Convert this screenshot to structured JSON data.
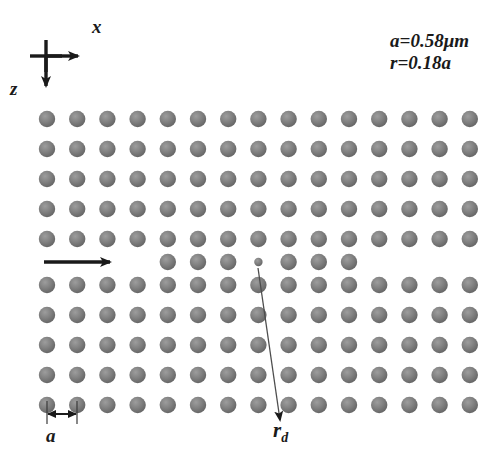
{
  "figure": {
    "type": "schematic",
    "width": 504,
    "height": 464,
    "background_color": "#ffffff",
    "rod_color": "#7a7a7a",
    "rod_highlight_color": "#a8a8a8",
    "rod_shadow_color": "#5a5a5a",
    "ink_color": "#1a1a1a"
  },
  "axes": {
    "x_label": "x",
    "z_label": "z",
    "origin": {
      "x": 46,
      "y": 56
    },
    "x_arrow_direction": "right",
    "z_arrow_direction": "down"
  },
  "parameters": {
    "lattice_constant_line": "a=0.58μm",
    "radius_line": "r=0.18a",
    "lattice_constant_symbol": "a",
    "lattice_constant_value": "0.58",
    "lattice_constant_unit": "μm",
    "radius_symbol": "r",
    "radius_value": "0.18a"
  },
  "labels": {
    "lattice_spacing": "a",
    "defect_radius": "r",
    "defect_radius_subscript": "d"
  },
  "lattice": {
    "columns": 15,
    "rows_top_block": 5,
    "rows_bottom_block": 5,
    "x_start": 47,
    "y_start_top": 119,
    "y_start_bottom": 285,
    "spacing_x": 30.2,
    "spacing_y": 30,
    "rod_radius": 8.2,
    "defect_rod_radius": 4.2,
    "waveguide_row_y": 262,
    "waveguide_row_columns": [
      4,
      5,
      6,
      7,
      8,
      9,
      10
    ],
    "defect_column_index": 7
  },
  "input_arrow": {
    "name": "incident-wave-arrow",
    "x1": 44,
    "y1": 262,
    "x2": 118,
    "y2": 262,
    "direction": "right"
  },
  "leader_line": {
    "name": "defect-leader-line",
    "x1": 258,
    "y1": 266,
    "x2": 281,
    "y2": 424
  },
  "dimension_marker": {
    "name": "lattice-constant-dimension",
    "left_x": 47,
    "right_x": 77,
    "y": 415,
    "tick_top": 403
  },
  "chart_data": {
    "type": "scatter",
    "xlabel": "x",
    "ylabel": "z",
    "annotations": [
      "a=0.58μm",
      "r=0.18a",
      "a",
      "r_d",
      "x",
      "z"
    ]
  }
}
